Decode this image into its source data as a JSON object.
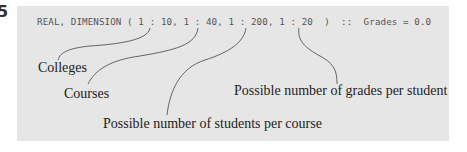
{
  "figure": {
    "number_fragment": "5",
    "code_line": "REAL, DIMENSION ( 1 : 10, 1 : 40, 1 : 200, 1 : 20  )  ::  Grades = 0.0",
    "annotations": [
      {
        "id": "colleges",
        "label": "Colleges",
        "points_to": "1 : 10"
      },
      {
        "id": "courses",
        "label": "Courses",
        "points_to": "1 : 40"
      },
      {
        "id": "students",
        "label": "Possible number of students per course",
        "points_to": "1 : 200"
      },
      {
        "id": "grades",
        "label": "Possible number of grades per student",
        "points_to": "1 : 20"
      }
    ],
    "colors": {
      "panel_background": "#e6e6e6",
      "code_text": "#555555",
      "label_text": "#222222",
      "leader_line": "#555555"
    }
  }
}
